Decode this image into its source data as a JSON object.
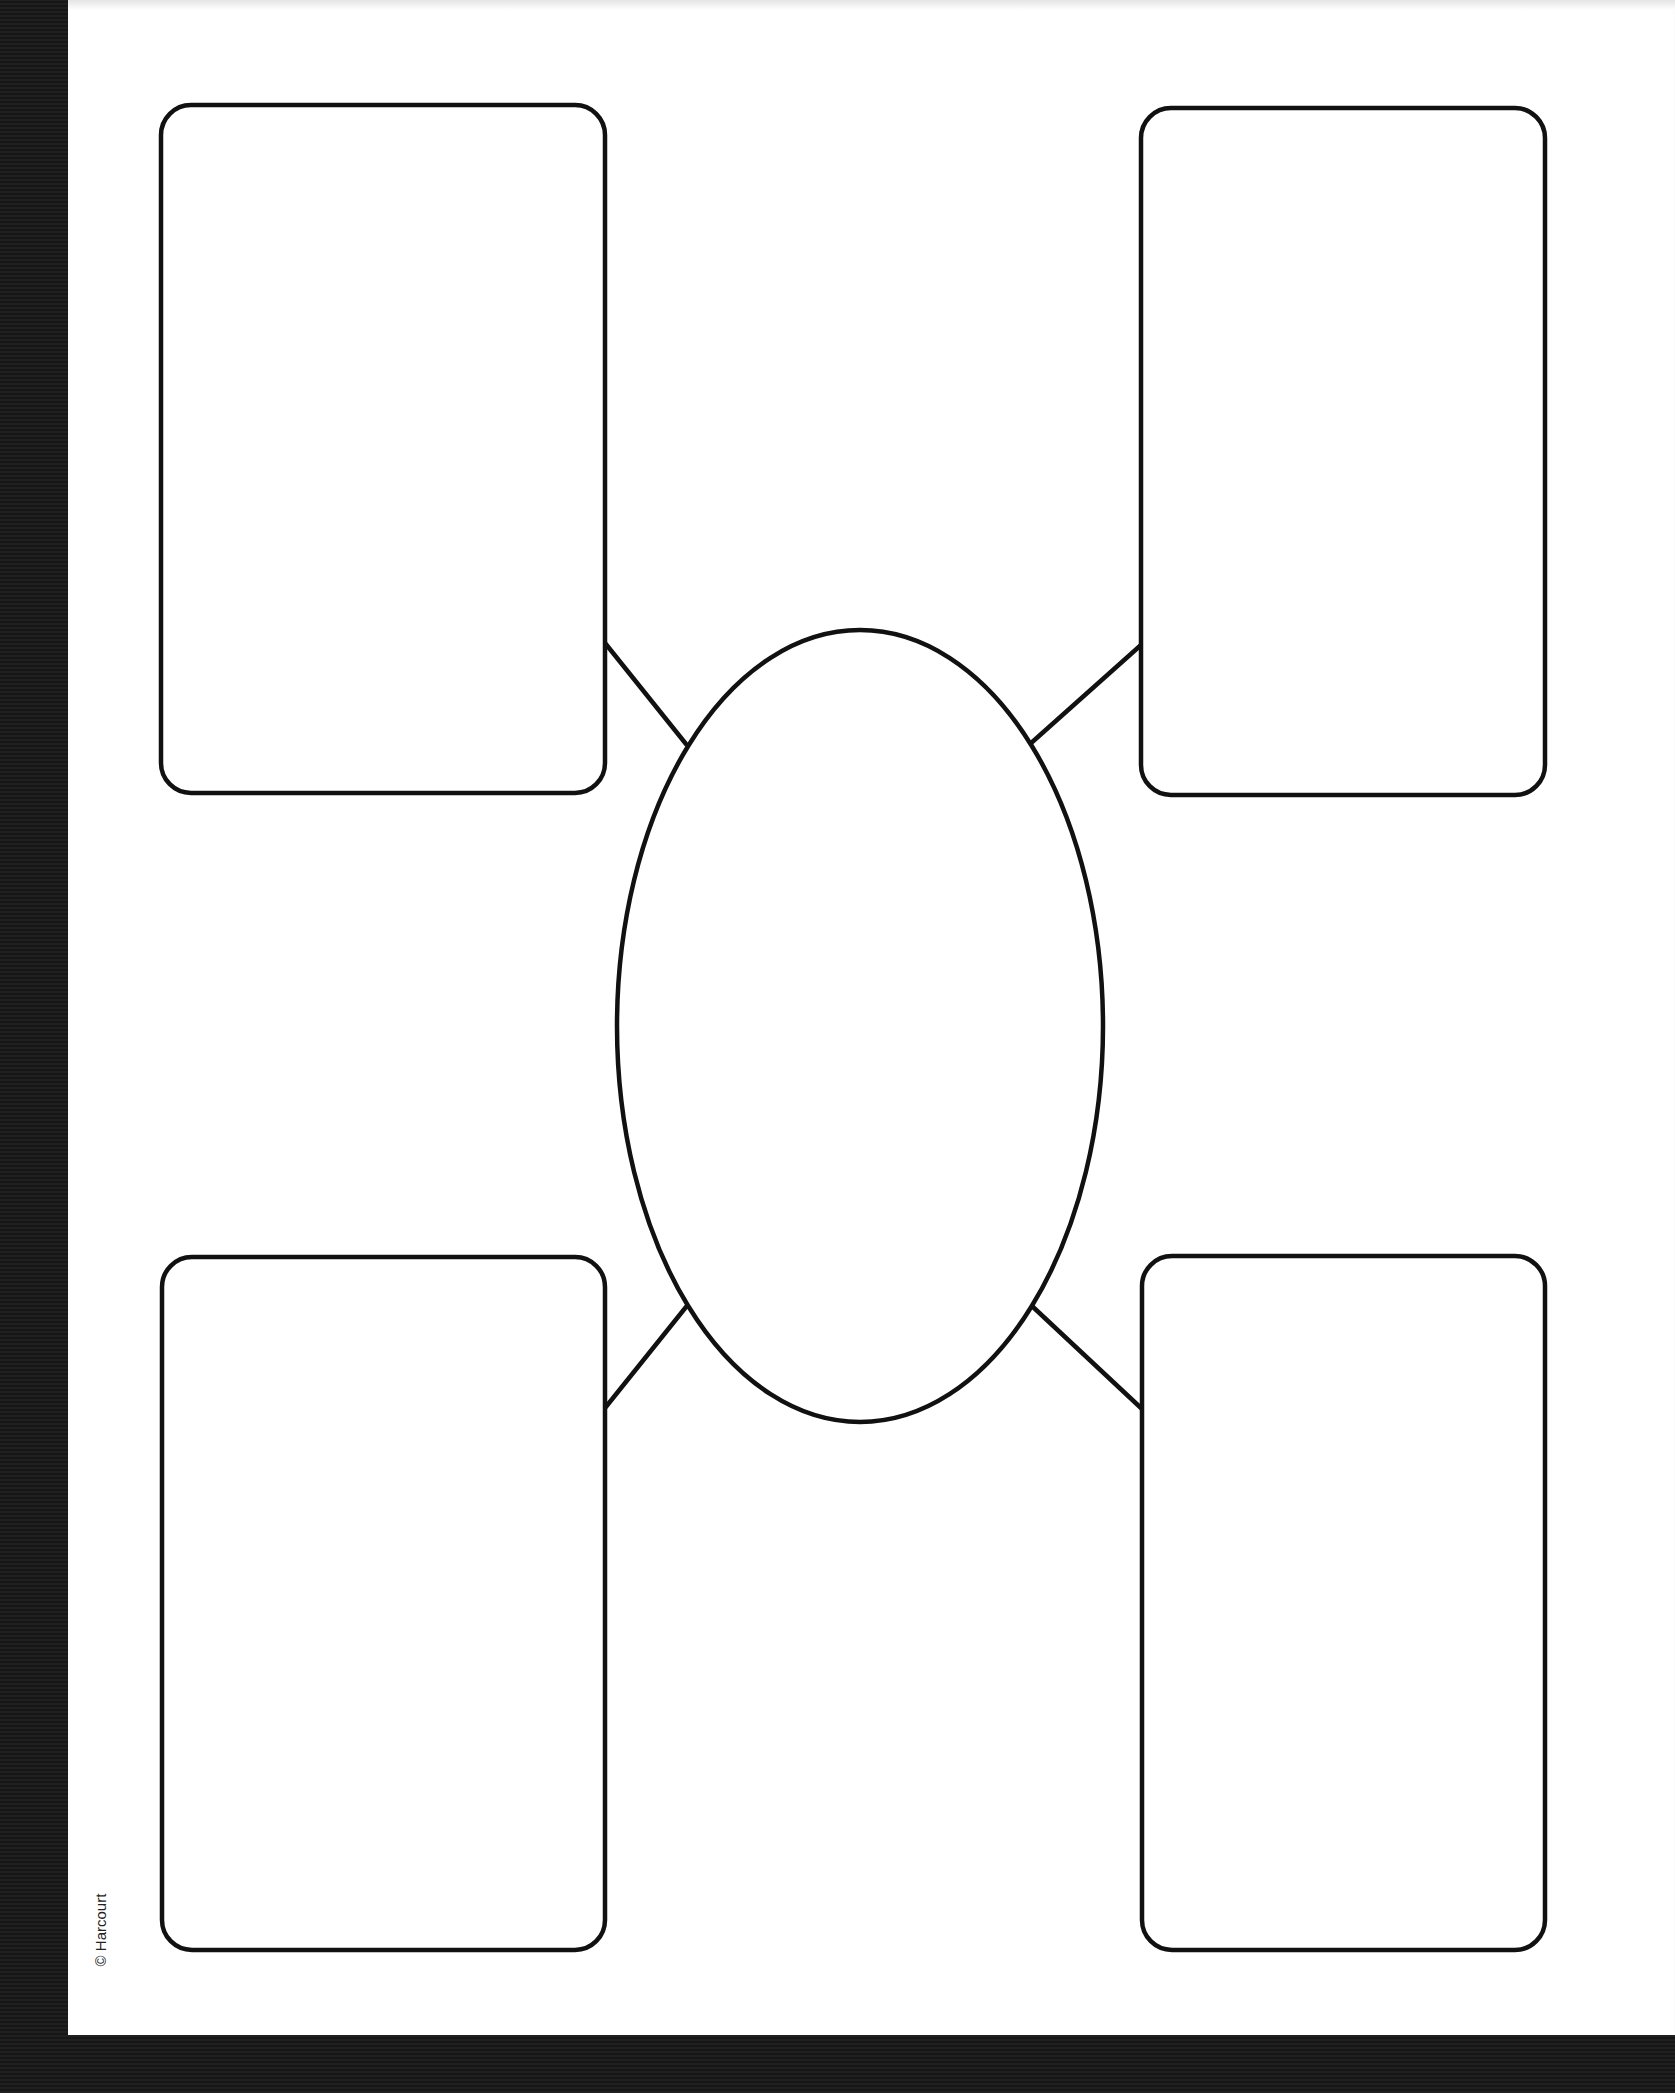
{
  "worksheet": {
    "type": "graphic-organizer",
    "layout": "four boxes connected to central oval",
    "copyright": "© Harcourt",
    "stroke_color": "#111111",
    "page_color": "#ffffff",
    "background_color": "#1c1c1c",
    "center_oval": {
      "cx": 860,
      "cy": 1026,
      "rx": 243,
      "ry": 396,
      "content": ""
    },
    "boxes": [
      {
        "id": "top-left",
        "x": 161,
        "y": 105,
        "w": 444,
        "h": 688,
        "content": ""
      },
      {
        "id": "top-right",
        "x": 1141,
        "y": 108,
        "w": 404,
        "h": 687,
        "content": ""
      },
      {
        "id": "bottom-left",
        "x": 162,
        "y": 1257,
        "w": 443,
        "h": 693,
        "content": ""
      },
      {
        "id": "bottom-right",
        "x": 1142,
        "y": 1256,
        "w": 403,
        "h": 694,
        "content": ""
      }
    ],
    "connectors": [
      {
        "id": "top-left",
        "x1": 605,
        "y1": 643,
        "x2": 686,
        "y2": 744
      },
      {
        "id": "top-right",
        "x1": 1141,
        "y1": 645,
        "x2": 1030,
        "y2": 744
      },
      {
        "id": "bottom-left",
        "x1": 605,
        "y1": 1408,
        "x2": 686,
        "y2": 1307
      },
      {
        "id": "bottom-right",
        "x1": 1141,
        "y1": 1408,
        "x2": 1033,
        "y2": 1307
      }
    ]
  }
}
